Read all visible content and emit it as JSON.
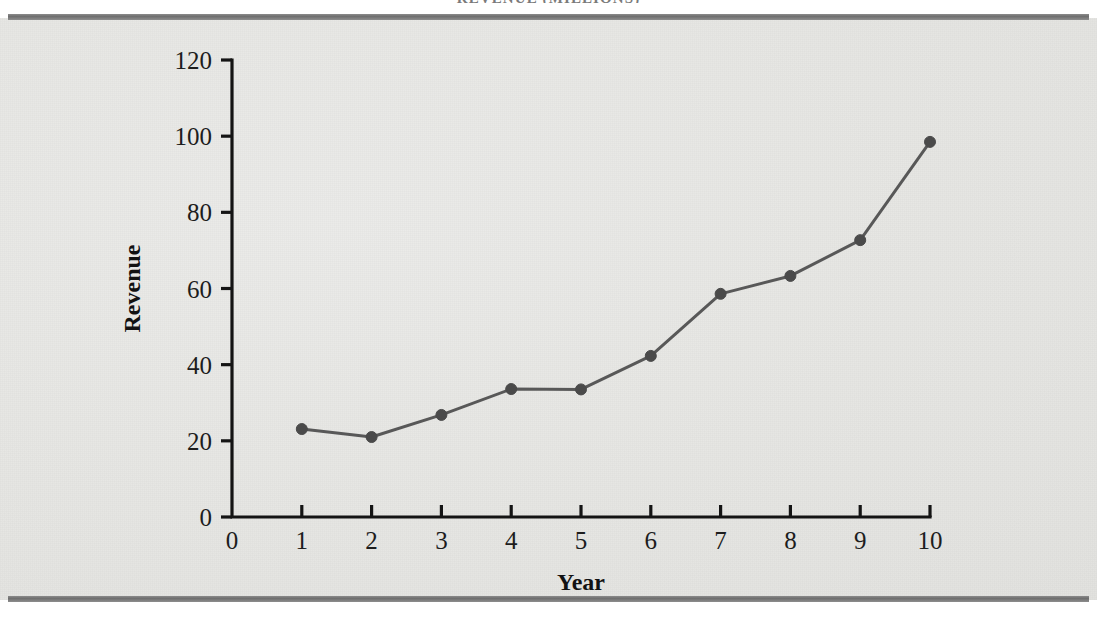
{
  "page": {
    "running_title": "REVENUE (MILLIONS)",
    "bleed_text_1": "                                                                                                      ",
    "bleed_text_2": "                                                                                                      ",
    "bleed_text_3": "                                                                                                      ",
    "bleed_text_4": "                                                                                                      "
  },
  "colors": {
    "paper": "#e8e8e5",
    "rule": "#7c7c7c",
    "axis": "#141414",
    "series_line": "#585858",
    "series_marker": "#4a4a4a",
    "tick_text": "#1d1d1d"
  },
  "chart_data": {
    "type": "line",
    "title": "",
    "xlabel": "Year",
    "ylabel": "Revenue",
    "xlim": [
      0,
      10
    ],
    "ylim": [
      0,
      120
    ],
    "grid": false,
    "legend": null,
    "x": [
      1,
      2,
      3,
      4,
      5,
      6,
      7,
      8,
      9,
      10
    ],
    "values": [
      23.1,
      21.0,
      26.8,
      33.6,
      33.5,
      42.3,
      58.6,
      63.3,
      72.7,
      98.5
    ],
    "series": [
      {
        "name": "Revenue",
        "values": [
          23.1,
          21.0,
          26.8,
          33.6,
          33.5,
          42.3,
          58.6,
          63.3,
          72.7,
          98.5
        ]
      }
    ],
    "xticks": [
      0,
      1,
      2,
      3,
      4,
      5,
      6,
      7,
      8,
      9,
      10
    ],
    "xticklabels": [
      "0",
      "1",
      "2",
      "3",
      "4",
      "5",
      "6",
      "7",
      "8",
      "9",
      "10"
    ],
    "yticks": [
      0,
      20,
      40,
      60,
      80,
      100,
      120
    ],
    "yticklabels": [
      "0",
      "20",
      "40",
      "60",
      "80",
      "100",
      "120"
    ],
    "marker": "circle",
    "marker_size": 11,
    "line_width": 3
  }
}
